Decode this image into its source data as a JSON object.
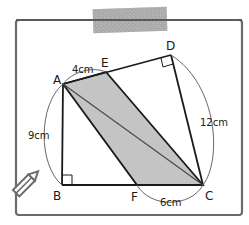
{
  "diagram": {
    "type": "geometry-figure",
    "vertices": {
      "A": {
        "label": "A",
        "x": 63,
        "y": 84
      },
      "B": {
        "label": "B",
        "x": 62,
        "y": 185
      },
      "C": {
        "label": "C",
        "x": 203,
        "y": 185
      },
      "D": {
        "label": "D",
        "x": 171,
        "y": 55
      },
      "E": {
        "label": "E",
        "x": 106,
        "y": 72
      },
      "F": {
        "label": "F",
        "x": 137,
        "y": 185
      }
    },
    "measurements": {
      "AE": "4cm",
      "AB": "9cm",
      "DC": "12cm",
      "FC": "6cm"
    },
    "right_angles": [
      "B",
      "D"
    ],
    "shaded_region": "AECF",
    "diagonal": "AC",
    "colors": {
      "line": "#1a1a1a",
      "shade": "#c4c4c4",
      "frame": "#6b6b6b",
      "tape": "#a8a8a8",
      "arc": "#555555"
    }
  }
}
